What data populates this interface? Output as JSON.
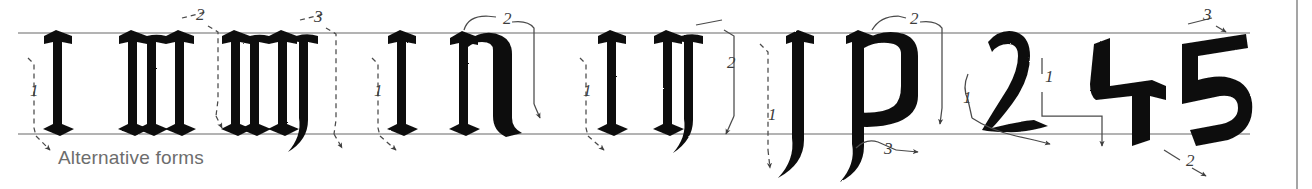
{
  "page": {
    "caption": "Alternative forms",
    "background_color": "#ffffff",
    "ink_color": "#111111",
    "guideline_color": "#9a9a9a",
    "annotation_color": "#4a4a4a",
    "caption_color": "#6d6d6d",
    "margin_rule_color": "#8f8f8f"
  },
  "guidelines": {
    "x_height_y": 33,
    "baseline_y": 134,
    "left_x": 18,
    "right_x": 1250,
    "margin_rule_x": 1297
  },
  "groups": [
    {
      "name": "alternative-forms-group",
      "glyphs": [
        "i",
        "n",
        "m"
      ],
      "stroke_numbers": [
        "1",
        "2",
        "3"
      ],
      "caption": "Alternative forms"
    },
    {
      "name": "i-n-round-group",
      "glyphs": [
        "i",
        "n"
      ],
      "stroke_numbers": [
        "1",
        "2"
      ]
    },
    {
      "name": "i-n-tailed-group",
      "glyphs": [
        "i",
        "n"
      ],
      "stroke_numbers": [
        "1",
        "2"
      ]
    },
    {
      "name": "j-p-group",
      "glyphs": [
        "j",
        "p"
      ],
      "stroke_numbers": [
        "1",
        "2",
        "3"
      ]
    },
    {
      "name": "numerals-group",
      "glyphs": [
        "2",
        "4",
        "5"
      ],
      "stroke_numbers": [
        "1",
        "1",
        "3",
        "2"
      ]
    }
  ],
  "stroke_labels": [
    {
      "id": "i1-alt",
      "text": "1",
      "x": 30,
      "y": 96
    },
    {
      "id": "n2-alt",
      "text": "2",
      "x": 196,
      "y": 20
    },
    {
      "id": "m3-alt",
      "text": "3",
      "x": 314,
      "y": 22
    },
    {
      "id": "i1-b",
      "text": "1",
      "x": 374,
      "y": 96
    },
    {
      "id": "n2-b",
      "text": "2",
      "x": 503,
      "y": 24
    },
    {
      "id": "i1-c",
      "text": "1",
      "x": 583,
      "y": 96
    },
    {
      "id": "n2-c",
      "text": "2",
      "x": 727,
      "y": 68
    },
    {
      "id": "j1",
      "text": "1",
      "x": 768,
      "y": 120
    },
    {
      "id": "p2",
      "text": "2",
      "x": 910,
      "y": 24
    },
    {
      "id": "p3",
      "text": "3",
      "x": 884,
      "y": 154
    },
    {
      "id": "two1",
      "text": "1",
      "x": 963,
      "y": 103
    },
    {
      "id": "four1",
      "text": "1",
      "x": 1045,
      "y": 82
    },
    {
      "id": "five3",
      "text": "3",
      "x": 1203,
      "y": 20
    },
    {
      "id": "five2",
      "text": "2",
      "x": 1186,
      "y": 166
    }
  ]
}
